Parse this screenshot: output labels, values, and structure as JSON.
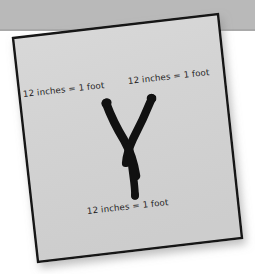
{
  "scene": {
    "kind": "photo-of-paper-note",
    "background_color": "#ffffff",
    "top_band_color": "#b9b9b9",
    "paper_color": "#d4d4d4",
    "paper_border_color": "#141414",
    "ink_color": "#111111"
  },
  "paper": {
    "corners": {
      "top_left": "13,38",
      "top_right": "218,14",
      "bottom_right": "242,238",
      "bottom_left": "38,262"
    }
  },
  "drawing": {
    "glyph": "Y",
    "description": "hand-drawn brush-stroke letter Y",
    "color": "#111111"
  },
  "labels": {
    "left": "12 inches = 1 foot",
    "right": "12 inches = 1 foot",
    "bottom": "12 inches = 1 foot"
  }
}
